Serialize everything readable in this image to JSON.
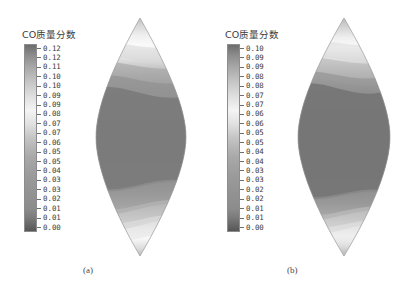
{
  "figure": {
    "background": "#ffffff",
    "width": 406,
    "height": 294
  },
  "panels": [
    {
      "id": "a",
      "caption": "(a)",
      "legend_title": "CO质量分数",
      "colorbar": {
        "orientation": "vertical",
        "min": 0.0,
        "max": 0.12,
        "tick_labels": [
          "0.12",
          "0.12",
          "0.11",
          "0.10",
          "0.10",
          "0.09",
          "0.09",
          "0.08",
          "0.07",
          "0.07",
          "0.06",
          "0.05",
          "0.05",
          "0.04",
          "0.03",
          "0.03",
          "0.02",
          "0.01",
          "0.01",
          "0.00"
        ],
        "stops": [
          {
            "pos": 0.0,
            "color": "#6d6d6d"
          },
          {
            "pos": 0.05,
            "color": "#8a8a8a"
          },
          {
            "pos": 0.12,
            "color": "#a8a8a8"
          },
          {
            "pos": 0.2,
            "color": "#c6c6c6"
          },
          {
            "pos": 0.28,
            "color": "#e0e0e0"
          },
          {
            "pos": 0.35,
            "color": "#f4f4f4"
          },
          {
            "pos": 0.42,
            "color": "#e2e2e2"
          },
          {
            "pos": 0.5,
            "color": "#c4c4c4"
          },
          {
            "pos": 0.6,
            "color": "#a9a9a9"
          },
          {
            "pos": 0.7,
            "color": "#9b9b9b"
          },
          {
            "pos": 0.8,
            "color": "#929292"
          },
          {
            "pos": 0.88,
            "color": "#8c8c8c"
          },
          {
            "pos": 0.93,
            "color": "#7a7a7a"
          },
          {
            "pos": 1.0,
            "color": "#565656"
          }
        ]
      }
    },
    {
      "id": "b",
      "caption": "(b)",
      "legend_title": "CO质量分数",
      "colorbar": {
        "orientation": "vertical",
        "min": 0.0,
        "max": 0.1,
        "tick_labels": [
          "0.10",
          "0.09",
          "0.09",
          "0.08",
          "0.08",
          "0.07",
          "0.07",
          "0.06",
          "0.06",
          "0.05",
          "0.05",
          "0.04",
          "0.04",
          "0.03",
          "0.03",
          "0.02",
          "0.02",
          "0.01",
          "0.01",
          "0.00"
        ],
        "stops": [
          {
            "pos": 0.0,
            "color": "#6d6d6d"
          },
          {
            "pos": 0.05,
            "color": "#8a8a8a"
          },
          {
            "pos": 0.12,
            "color": "#a8a8a8"
          },
          {
            "pos": 0.2,
            "color": "#c6c6c6"
          },
          {
            "pos": 0.28,
            "color": "#e0e0e0"
          },
          {
            "pos": 0.35,
            "color": "#f4f4f4"
          },
          {
            "pos": 0.42,
            "color": "#e2e2e2"
          },
          {
            "pos": 0.5,
            "color": "#c4c4c4"
          },
          {
            "pos": 0.6,
            "color": "#a9a9a9"
          },
          {
            "pos": 0.7,
            "color": "#9b9b9b"
          },
          {
            "pos": 0.8,
            "color": "#929292"
          },
          {
            "pos": 0.88,
            "color": "#8c8c8c"
          },
          {
            "pos": 0.93,
            "color": "#7a7a7a"
          },
          {
            "pos": 1.0,
            "color": "#565656"
          }
        ]
      }
    }
  ],
  "chart_data": {
    "type": "heatmap",
    "title": "CO质量分数",
    "subtitle": "",
    "xlabel": "",
    "ylabel": "",
    "grid": false,
    "legend_position": "left",
    "panels": [
      {
        "id": "a",
        "caption": "(a)",
        "colorbar_label": "CO质量分数",
        "value_range": [
          0.0,
          0.12
        ],
        "tick_values": [
          0.12,
          0.12,
          0.11,
          0.1,
          0.1,
          0.09,
          0.09,
          0.08,
          0.07,
          0.07,
          0.06,
          0.05,
          0.05,
          0.04,
          0.03,
          0.03,
          0.02,
          0.01,
          0.01,
          0.0
        ],
        "domain_shape": "lens",
        "bands_top_to_bottom": [
          {
            "y_frac": 0.0,
            "value": 0.02
          },
          {
            "y_frac": 0.05,
            "value": 0.05
          },
          {
            "y_frac": 0.1,
            "value": 0.07
          },
          {
            "y_frac": 0.14,
            "value": 0.09
          },
          {
            "y_frac": 0.18,
            "value": 0.08
          },
          {
            "y_frac": 0.24,
            "value": 0.06
          },
          {
            "y_frac": 0.3,
            "value": 0.04
          },
          {
            "y_frac": 0.38,
            "value": 0.02
          },
          {
            "y_frac": 0.5,
            "value": 0.01
          },
          {
            "y_frac": 0.62,
            "value": 0.01
          },
          {
            "y_frac": 0.7,
            "value": 0.03
          },
          {
            "y_frac": 0.78,
            "value": 0.05
          },
          {
            "y_frac": 0.84,
            "value": 0.08
          },
          {
            "y_frac": 0.89,
            "value": 0.09
          },
          {
            "y_frac": 0.94,
            "value": 0.06
          },
          {
            "y_frac": 1.0,
            "value": 0.03
          }
        ]
      },
      {
        "id": "b",
        "caption": "(b)",
        "colorbar_label": "CO质量分数",
        "value_range": [
          0.0,
          0.1
        ],
        "tick_values": [
          0.1,
          0.09,
          0.09,
          0.08,
          0.08,
          0.07,
          0.07,
          0.06,
          0.06,
          0.05,
          0.05,
          0.04,
          0.04,
          0.03,
          0.03,
          0.02,
          0.02,
          0.01,
          0.01,
          0.0
        ],
        "domain_shape": "lens",
        "bands_top_to_bottom": [
          {
            "y_frac": 0.0,
            "value": 0.02
          },
          {
            "y_frac": 0.06,
            "value": 0.05
          },
          {
            "y_frac": 0.11,
            "value": 0.08
          },
          {
            "y_frac": 0.16,
            "value": 0.07
          },
          {
            "y_frac": 0.22,
            "value": 0.05
          },
          {
            "y_frac": 0.28,
            "value": 0.03
          },
          {
            "y_frac": 0.34,
            "value": 0.01
          },
          {
            "y_frac": 0.5,
            "value": 0.01
          },
          {
            "y_frac": 0.66,
            "value": 0.01
          },
          {
            "y_frac": 0.74,
            "value": 0.03
          },
          {
            "y_frac": 0.81,
            "value": 0.05
          },
          {
            "y_frac": 0.87,
            "value": 0.08
          },
          {
            "y_frac": 0.92,
            "value": 0.07
          },
          {
            "y_frac": 1.0,
            "value": 0.03
          }
        ]
      }
    ]
  }
}
